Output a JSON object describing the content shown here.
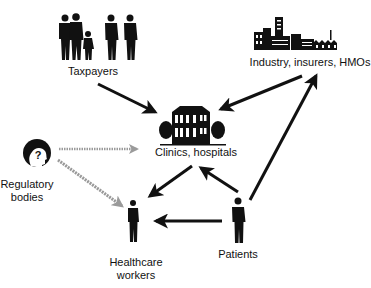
{
  "diagram": {
    "nodes": [
      {
        "id": "taxpayers",
        "label": "Taxpayers",
        "icon": "people-group-icon"
      },
      {
        "id": "industry",
        "label": "Industry, insurers, HMOs",
        "icon": "city-skyline-icon"
      },
      {
        "id": "clinics",
        "label": "Clinics, hospitals",
        "icon": "hospital-building-icon"
      },
      {
        "id": "regulatory",
        "label_line1": "Regulatory",
        "label_line2": "bodies",
        "icon": "head-question-icon"
      },
      {
        "id": "healthcare",
        "label_line1": "Healthcare",
        "label_line2": "workers",
        "icon": "doctor-figure-icon"
      },
      {
        "id": "patients",
        "label": "Patients",
        "icon": "person-figure-icon"
      }
    ],
    "edges": [
      {
        "from": "taxpayers",
        "to": "clinics",
        "style": "solid"
      },
      {
        "from": "industry",
        "to": "clinics",
        "style": "solid"
      },
      {
        "from": "patients",
        "to": "industry",
        "style": "solid"
      },
      {
        "from": "patients",
        "to": "clinics",
        "style": "solid"
      },
      {
        "from": "clinics",
        "to": "healthcare",
        "style": "solid"
      },
      {
        "from": "patients",
        "to": "healthcare",
        "style": "solid"
      },
      {
        "from": "regulatory",
        "to": "clinics",
        "style": "grey-dotted"
      },
      {
        "from": "regulatory",
        "to": "healthcare",
        "style": "grey-hatched"
      }
    ],
    "colors": {
      "solid": "#111111",
      "regulatory": "#9a9a9a"
    }
  }
}
